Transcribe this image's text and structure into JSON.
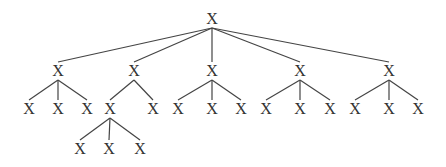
{
  "diagram": {
    "type": "tree",
    "colors": {
      "line": "#444444",
      "text": "#333333",
      "background": "#ffffff"
    },
    "nodes": [
      {
        "id": "n0",
        "label": "X",
        "x": 212,
        "y": 19
      },
      {
        "id": "n1",
        "label": "X",
        "x": 58,
        "y": 71
      },
      {
        "id": "n2",
        "label": "X",
        "x": 134,
        "y": 71
      },
      {
        "id": "n3",
        "label": "X",
        "x": 212,
        "y": 71
      },
      {
        "id": "n4",
        "label": "X",
        "x": 300,
        "y": 71
      },
      {
        "id": "n5",
        "label": "X",
        "x": 389,
        "y": 71
      },
      {
        "id": "n1a",
        "label": "X",
        "x": 29,
        "y": 109
      },
      {
        "id": "n1b",
        "label": "X",
        "x": 58,
        "y": 109
      },
      {
        "id": "n1c",
        "label": "X",
        "x": 87,
        "y": 109
      },
      {
        "id": "n2a",
        "label": "X",
        "x": 110,
        "y": 109
      },
      {
        "id": "n2b",
        "label": "X",
        "x": 153,
        "y": 109
      },
      {
        "id": "n3a",
        "label": "X",
        "x": 178,
        "y": 109
      },
      {
        "id": "n3b",
        "label": "X",
        "x": 212,
        "y": 109
      },
      {
        "id": "n3c",
        "label": "X",
        "x": 241,
        "y": 109
      },
      {
        "id": "n4a",
        "label": "X",
        "x": 266,
        "y": 109
      },
      {
        "id": "n4b",
        "label": "X",
        "x": 300,
        "y": 109
      },
      {
        "id": "n4c",
        "label": "X",
        "x": 330,
        "y": 109
      },
      {
        "id": "n5a",
        "label": "X",
        "x": 355,
        "y": 109
      },
      {
        "id": "n5b",
        "label": "X",
        "x": 389,
        "y": 109
      },
      {
        "id": "n5c",
        "label": "X",
        "x": 418,
        "y": 109
      },
      {
        "id": "n2a1",
        "label": "X",
        "x": 80,
        "y": 149
      },
      {
        "id": "n2a2",
        "label": "X",
        "x": 109,
        "y": 149
      },
      {
        "id": "n2a3",
        "label": "X",
        "x": 140,
        "y": 149
      }
    ],
    "edges": [
      [
        "n0",
        "n1"
      ],
      [
        "n0",
        "n2"
      ],
      [
        "n0",
        "n3"
      ],
      [
        "n0",
        "n4"
      ],
      [
        "n0",
        "n5"
      ],
      [
        "n1",
        "n1a"
      ],
      [
        "n1",
        "n1b"
      ],
      [
        "n1",
        "n1c"
      ],
      [
        "n2",
        "n2a"
      ],
      [
        "n2",
        "n2b"
      ],
      [
        "n3",
        "n3a"
      ],
      [
        "n3",
        "n3b"
      ],
      [
        "n3",
        "n3c"
      ],
      [
        "n4",
        "n4a"
      ],
      [
        "n4",
        "n4b"
      ],
      [
        "n4",
        "n4c"
      ],
      [
        "n5",
        "n5a"
      ],
      [
        "n5",
        "n5b"
      ],
      [
        "n5",
        "n5c"
      ],
      [
        "n2a",
        "n2a1"
      ],
      [
        "n2a",
        "n2a2"
      ],
      [
        "n2a",
        "n2a3"
      ]
    ]
  }
}
